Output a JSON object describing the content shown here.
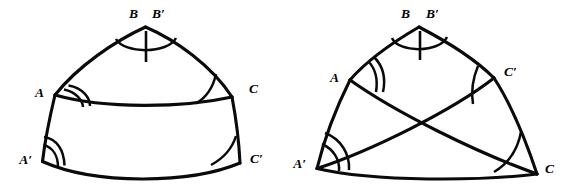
{
  "figure": {
    "kind": "geometry-diagram",
    "stroke_color": "#0a0a0a",
    "background_color": "#ffffff",
    "panels": [
      {
        "id": "left",
        "name": "nested-triangles-figure",
        "caption": "",
        "vertices": [
          {
            "key": "B",
            "label": "B",
            "x": 138,
            "y": 18,
            "anchor": "end",
            "angle_marks": 1,
            "tick_marks": 1
          },
          {
            "key": "Bp",
            "label": "B′",
            "x": 152,
            "y": 18,
            "anchor": "start",
            "angle_marks": 0,
            "tick_marks": 0
          },
          {
            "key": "A",
            "label": "A",
            "x": 44,
            "y": 97,
            "anchor": "end",
            "angle_marks": 2,
            "tick_marks": 0
          },
          {
            "key": "C",
            "label": "C",
            "x": 249,
            "y": 93,
            "anchor": "start",
            "angle_marks": 1,
            "tick_marks": 0
          },
          {
            "key": "Ap",
            "label": "A′",
            "x": 32,
            "y": 164,
            "anchor": "end",
            "angle_marks": 2,
            "tick_marks": 0
          },
          {
            "key": "Cp",
            "label": "C′",
            "x": 250,
            "y": 163,
            "anchor": "start",
            "angle_marks": 1,
            "tick_marks": 0
          }
        ]
      },
      {
        "id": "right",
        "name": "crossed-triangles-figure",
        "caption": "",
        "vertices": [
          {
            "key": "B",
            "label": "B",
            "x": 125,
            "y": 18,
            "anchor": "end",
            "angle_marks": 1,
            "tick_marks": 1
          },
          {
            "key": "Bp",
            "label": "B′",
            "x": 141,
            "y": 18,
            "anchor": "start",
            "angle_marks": 0,
            "tick_marks": 0
          },
          {
            "key": "A",
            "label": "A",
            "x": 54,
            "y": 82,
            "anchor": "end",
            "angle_marks": 2,
            "tick_marks": 0
          },
          {
            "key": "Cp",
            "label": "C′",
            "x": 219,
            "y": 76,
            "anchor": "start",
            "angle_marks": 1,
            "tick_marks": 0
          },
          {
            "key": "Ap",
            "label": "A′",
            "x": 21,
            "y": 168,
            "anchor": "end",
            "angle_marks": 2,
            "tick_marks": 0
          },
          {
            "key": "C",
            "label": "C",
            "x": 260,
            "y": 173,
            "anchor": "start",
            "angle_marks": 1,
            "tick_marks": 0
          }
        ]
      }
    ]
  },
  "overflow_text": {
    "top_cropped_line": ""
  }
}
